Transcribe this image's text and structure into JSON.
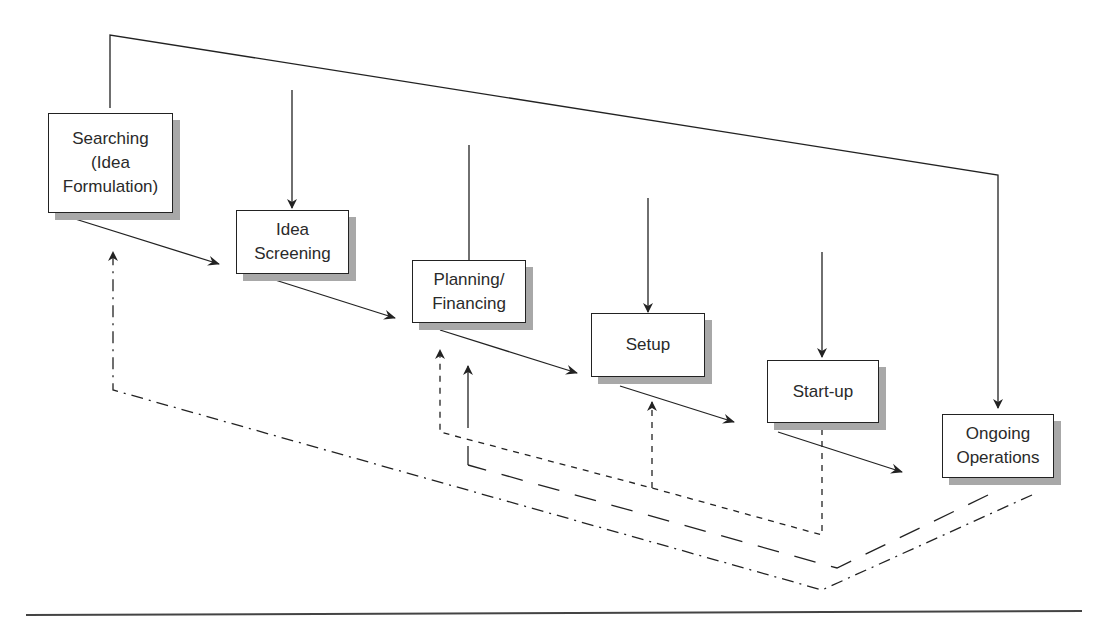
{
  "diagram": {
    "type": "process-flow",
    "stages": [
      {
        "id": "searching",
        "label": "Searching\n(Idea\nFormulation)"
      },
      {
        "id": "screening",
        "label": "Idea\nScreening"
      },
      {
        "id": "planning",
        "label": "Planning/\nFinancing"
      },
      {
        "id": "setup",
        "label": "Setup"
      },
      {
        "id": "startup",
        "label": "Start-up"
      },
      {
        "id": "ongoing",
        "label": "Ongoing\nOperations"
      }
    ],
    "feedback_loops": [
      {
        "from": "startup",
        "to": [
          "planning",
          "setup"
        ],
        "style": "short-dash"
      },
      {
        "from": "ongoing",
        "to": [
          "planning"
        ],
        "style": "long-dash"
      },
      {
        "from": "ongoing",
        "to": [
          "searching"
        ],
        "style": "dash-dot"
      }
    ],
    "colors": {
      "line": "#222222",
      "shadow": "#a8a8a8",
      "text": "#2a2a2a"
    }
  }
}
